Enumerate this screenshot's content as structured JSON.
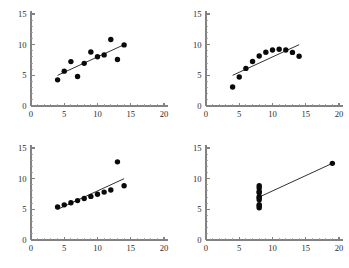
{
  "figure": {
    "title": "",
    "background_color": "#ffffff",
    "axis_color": "#828282",
    "point_color": "#0a0a0a",
    "line_color": "#1a1a1a",
    "rows": 2,
    "cols": 2
  },
  "axes": {
    "x_ticks": [
      0,
      5,
      10,
      15,
      20
    ],
    "y_ticks": [
      0,
      5,
      10,
      15
    ],
    "x_tick_labels": [
      "0",
      "5",
      "10",
      "15",
      "20"
    ],
    "y_tick_labels": [
      "0",
      "5",
      "10",
      "15"
    ],
    "xlim": [
      0,
      20
    ],
    "ylim": [
      0,
      15
    ],
    "x_minor_step": 1,
    "y_minor_step": 1,
    "grid": false,
    "xlabel": "",
    "ylabel": ""
  },
  "chart_data": [
    {
      "type": "scatter",
      "name": "panel-1",
      "title": "",
      "xlabel": "",
      "ylabel": "",
      "xlim": [
        0,
        20
      ],
      "ylim": [
        0,
        15
      ],
      "x_ticks": [
        0,
        5,
        10,
        15,
        20
      ],
      "y_ticks": [
        0,
        5,
        10,
        15
      ],
      "grid": false,
      "legend": "none",
      "points": [
        {
          "x": 10.0,
          "y": 8.04
        },
        {
          "x": 8.0,
          "y": 6.95
        },
        {
          "x": 13.0,
          "y": 7.58
        },
        {
          "x": 9.0,
          "y": 8.81
        },
        {
          "x": 11.0,
          "y": 8.33
        },
        {
          "x": 14.0,
          "y": 9.96
        },
        {
          "x": 6.0,
          "y": 7.24
        },
        {
          "x": 4.0,
          "y": 4.26
        },
        {
          "x": 12.0,
          "y": 10.84
        },
        {
          "x": 7.0,
          "y": 4.82
        },
        {
          "x": 5.0,
          "y": 5.68
        }
      ],
      "fit_line": {
        "slope": 0.5,
        "intercept": 3.0,
        "x_start": 4.0,
        "x_end": 14.0
      }
    },
    {
      "type": "scatter",
      "name": "panel-2",
      "title": "",
      "xlabel": "",
      "ylabel": "",
      "xlim": [
        0,
        20
      ],
      "ylim": [
        0,
        15
      ],
      "x_ticks": [
        0,
        5,
        10,
        15,
        20
      ],
      "y_ticks": [
        0,
        5,
        10,
        15
      ],
      "grid": false,
      "legend": "none",
      "points": [
        {
          "x": 10.0,
          "y": 9.14
        },
        {
          "x": 8.0,
          "y": 8.14
        },
        {
          "x": 13.0,
          "y": 8.74
        },
        {
          "x": 9.0,
          "y": 8.77
        },
        {
          "x": 11.0,
          "y": 9.26
        },
        {
          "x": 14.0,
          "y": 8.1
        },
        {
          "x": 6.0,
          "y": 6.13
        },
        {
          "x": 4.0,
          "y": 3.1
        },
        {
          "x": 12.0,
          "y": 9.13
        },
        {
          "x": 7.0,
          "y": 7.26
        },
        {
          "x": 5.0,
          "y": 4.74
        }
      ],
      "fit_line": {
        "slope": 0.5,
        "intercept": 3.0,
        "x_start": 4.0,
        "x_end": 14.0
      }
    },
    {
      "type": "scatter",
      "name": "panel-3",
      "title": "",
      "xlabel": "",
      "ylabel": "",
      "xlim": [
        0,
        20
      ],
      "ylim": [
        0,
        15
      ],
      "x_ticks": [
        0,
        5,
        10,
        15,
        20
      ],
      "y_ticks": [
        0,
        5,
        10,
        15
      ],
      "grid": false,
      "legend": "none",
      "points": [
        {
          "x": 10.0,
          "y": 7.46
        },
        {
          "x": 8.0,
          "y": 6.77
        },
        {
          "x": 13.0,
          "y": 12.74
        },
        {
          "x": 9.0,
          "y": 7.11
        },
        {
          "x": 11.0,
          "y": 7.81
        },
        {
          "x": 14.0,
          "y": 8.84
        },
        {
          "x": 6.0,
          "y": 6.08
        },
        {
          "x": 4.0,
          "y": 5.39
        },
        {
          "x": 12.0,
          "y": 8.15
        },
        {
          "x": 7.0,
          "y": 6.42
        },
        {
          "x": 5.0,
          "y": 5.73
        }
      ],
      "fit_line": {
        "slope": 0.5,
        "intercept": 3.0,
        "x_start": 4.0,
        "x_end": 14.0
      }
    },
    {
      "type": "scatter",
      "name": "panel-4",
      "title": "",
      "xlabel": "",
      "ylabel": "",
      "xlim": [
        0,
        20
      ],
      "ylim": [
        0,
        15
      ],
      "x_ticks": [
        0,
        5,
        10,
        15,
        20
      ],
      "y_ticks": [
        0,
        5,
        10,
        15
      ],
      "grid": false,
      "legend": "none",
      "points": [
        {
          "x": 8.0,
          "y": 6.58
        },
        {
          "x": 8.0,
          "y": 5.76
        },
        {
          "x": 8.0,
          "y": 7.71
        },
        {
          "x": 8.0,
          "y": 8.84
        },
        {
          "x": 8.0,
          "y": 8.47
        },
        {
          "x": 8.0,
          "y": 7.04
        },
        {
          "x": 8.0,
          "y": 5.25
        },
        {
          "x": 19.0,
          "y": 12.5
        },
        {
          "x": 8.0,
          "y": 5.56
        },
        {
          "x": 8.0,
          "y": 7.91
        },
        {
          "x": 8.0,
          "y": 6.89
        }
      ],
      "fit_line": {
        "slope": 0.5,
        "intercept": 3.0,
        "x_start": 8.0,
        "x_end": 19.0
      }
    }
  ]
}
